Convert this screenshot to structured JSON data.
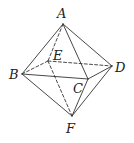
{
  "diagram": {
    "type": "octahedron",
    "line_color": "#333333",
    "vertices": [
      {
        "id": "A",
        "label": "A",
        "x": 63,
        "y": 24,
        "label_x": 57,
        "label_y": 18
      },
      {
        "id": "B",
        "label": "B",
        "x": 22,
        "y": 74,
        "label_x": 9,
        "label_y": 79
      },
      {
        "id": "C",
        "label": "C",
        "x": 88,
        "y": 79,
        "label_x": 73,
        "label_y": 93
      },
      {
        "id": "D",
        "label": "D",
        "x": 112,
        "y": 66,
        "label_x": 115,
        "label_y": 72
      },
      {
        "id": "E",
        "label": "E",
        "x": 48,
        "y": 61,
        "label_x": 53,
        "label_y": 60
      },
      {
        "id": "F",
        "label": "F",
        "x": 72,
        "y": 116,
        "label_x": 66,
        "label_y": 133
      }
    ],
    "edges": [
      {
        "from": "A",
        "to": "B",
        "style": "solid"
      },
      {
        "from": "A",
        "to": "C",
        "style": "solid"
      },
      {
        "from": "A",
        "to": "D",
        "style": "solid"
      },
      {
        "from": "B",
        "to": "C",
        "style": "solid"
      },
      {
        "from": "C",
        "to": "D",
        "style": "solid"
      },
      {
        "from": "B",
        "to": "F",
        "style": "solid"
      },
      {
        "from": "C",
        "to": "F",
        "style": "solid"
      },
      {
        "from": "D",
        "to": "F",
        "style": "solid"
      },
      {
        "from": "A",
        "to": "E",
        "style": "dashed"
      },
      {
        "from": "B",
        "to": "E",
        "style": "dashed"
      },
      {
        "from": "E",
        "to": "D",
        "style": "dashed"
      },
      {
        "from": "E",
        "to": "F",
        "style": "dashed"
      }
    ]
  }
}
